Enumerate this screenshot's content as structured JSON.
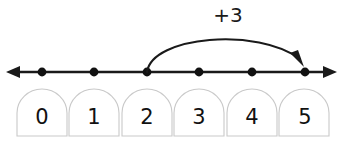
{
  "figure": {
    "kind": "number-line-jump-diagram",
    "background_color": "#ffffff",
    "line_color": "#1a1a1a",
    "cell_border_color": "#c9c9c9",
    "digit_color": "#111111"
  },
  "jump": {
    "label": "+3",
    "from_value": "2",
    "to_value": "5",
    "direction": "right"
  },
  "number_line": {
    "left_arrow_name": "left-arrow-head",
    "right_arrow_name": "right-arrow-head",
    "ticks": [
      {
        "value": "0"
      },
      {
        "value": "1"
      },
      {
        "value": "2"
      },
      {
        "value": "3"
      },
      {
        "value": "4"
      },
      {
        "value": "5"
      }
    ]
  },
  "cells": [
    {
      "label": "0"
    },
    {
      "label": "1"
    },
    {
      "label": "2"
    },
    {
      "label": "3"
    },
    {
      "label": "4"
    },
    {
      "label": "5"
    }
  ]
}
